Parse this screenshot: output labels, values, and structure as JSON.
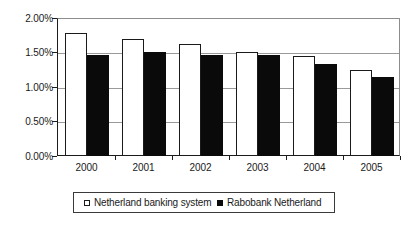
{
  "chart_data": {
    "type": "bar",
    "title": "",
    "subtitle": "",
    "xlabel": "",
    "ylabel": "",
    "categories": [
      "2000",
      "2001",
      "2002",
      "2003",
      "2004",
      "2005"
    ],
    "series": [
      {
        "name": "Netherland banking system",
        "marker": "open-square",
        "color": "#ffffff",
        "edge_color": "#1a1a1a",
        "values": [
          1.78,
          1.69,
          1.63,
          1.5,
          1.45,
          1.25
        ]
      },
      {
        "name": "Rabobank Netherland",
        "marker": "filled-square",
        "color": "#0a0a0a",
        "edge_color": "#0a0a0a",
        "values": [
          1.46,
          1.5,
          1.46,
          1.46,
          1.34,
          1.15
        ]
      }
    ],
    "ylim": [
      0.0,
      2.0
    ],
    "yticks": [
      0.0,
      0.5,
      1.0,
      1.5,
      2.0
    ],
    "ytick_labels": [
      "0.00%",
      "0.50%",
      "1.00%",
      "1.50%",
      "2.00%"
    ],
    "value_suffix": "%",
    "grid": true,
    "grid_axis": "y",
    "legend_position": "bottom",
    "legend_border": true
  },
  "axes": {
    "y_tick_labels": [
      "2.00%",
      "1.50%",
      "1.00%",
      "0.50%",
      "0.00%"
    ],
    "x_tick_labels": [
      "2000",
      "2001",
      "2002",
      "2003",
      "2004",
      "2005"
    ]
  },
  "legend": {
    "entries": [
      {
        "label": "Netherland banking system",
        "swatch": "open-square"
      },
      {
        "label": "Rabobank Netherland",
        "swatch": "filled-square"
      }
    ]
  }
}
